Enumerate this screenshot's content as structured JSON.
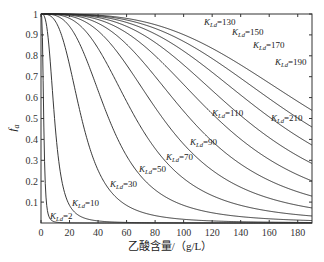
{
  "chart_data": {
    "type": "line",
    "title": "",
    "xlabel": "乙酸含量/（g/L）",
    "ylabel": "f_a",
    "xlim": [
      0,
      190
    ],
    "ylim": [
      0,
      1
    ],
    "x_ticks": [
      0,
      20,
      40,
      60,
      80,
      100,
      120,
      140,
      160,
      180
    ],
    "y_ticks": [
      0.1,
      0.2,
      0.3,
      0.4,
      0.5,
      0.6,
      0.7,
      0.8,
      0.9,
      1
    ],
    "y_tick_labels": [
      "0.1",
      "0.2",
      "0.3",
      "0.4",
      "0.5",
      "0.6",
      "0.7",
      "0.8",
      "0.9",
      "1"
    ],
    "x_tick_labels": [
      "0",
      "20",
      "40",
      "60",
      "80",
      "100",
      "120",
      "140",
      "160",
      "180"
    ],
    "grid": false,
    "series": [
      {
        "name": "K_Ld=2",
        "K": 2
      },
      {
        "name": "K_Ld=10",
        "K": 10
      },
      {
        "name": "K_Ld=30",
        "K": 30
      },
      {
        "name": "K_Ld=50",
        "K": 50
      },
      {
        "name": "K_Ld=70",
        "K": 70
      },
      {
        "name": "K_Ld=90",
        "K": 90
      },
      {
        "name": "K_Ld=110",
        "K": 110
      },
      {
        "name": "K_Ld=130",
        "K": 130
      },
      {
        "name": "K_Ld=150",
        "K": 150
      },
      {
        "name": "K_Ld=170",
        "K": 170
      },
      {
        "name": "K_Ld=190",
        "K": 190
      },
      {
        "name": "K_Ld=210",
        "K": 210
      }
    ],
    "annotations": [
      {
        "text": "K_Ld=130",
        "x": 204,
        "y": 25
      },
      {
        "text": "K_Ld=150",
        "x": 232,
        "y": 35
      },
      {
        "text": "K_Ld=170",
        "x": 253,
        "y": 48
      },
      {
        "text": "K_Ld=190",
        "x": 275,
        "y": 65
      },
      {
        "text": "K_Ld=210",
        "x": 271,
        "y": 121
      },
      {
        "text": "K_Ld=110",
        "x": 212,
        "y": 116
      },
      {
        "text": "K_Ld=90",
        "x": 190,
        "y": 145
      },
      {
        "text": "K_Ld=70",
        "x": 166,
        "y": 160
      },
      {
        "text": "K_Ld=50",
        "x": 139,
        "y": 172
      },
      {
        "text": "K_Ld=30",
        "x": 110,
        "y": 187
      },
      {
        "text": "K_Ld=10",
        "x": 72,
        "y": 206
      },
      {
        "text": "K_Ld=2",
        "x": 50,
        "y": 219
      }
    ]
  }
}
